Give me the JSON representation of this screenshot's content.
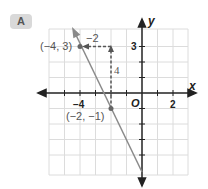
{
  "badge": {
    "label": "A"
  },
  "graph": {
    "x_axis_label": "x",
    "y_axis_label": "y",
    "origin_label": "O",
    "x_ticks": [
      "−4",
      "2"
    ],
    "y_ticks": [
      "3"
    ],
    "points": [
      {
        "label": "(−4, 3)",
        "x": -4,
        "y": 3
      },
      {
        "label": "(−2, −1)",
        "x": -2,
        "y": -1
      }
    ],
    "run_label": "−2",
    "rise_label": "4",
    "colors": {
      "line": "#8a8a8a",
      "grid": "#dcdcdc",
      "axis": "#222222",
      "dashed": "#555555"
    }
  }
}
